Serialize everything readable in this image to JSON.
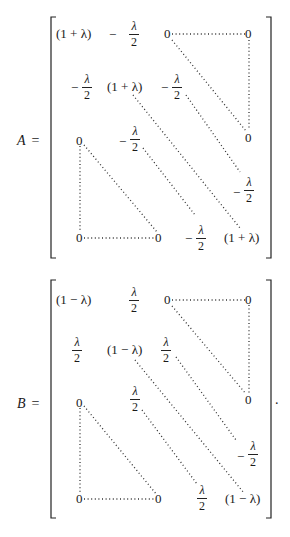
{
  "matrices": [
    {
      "label": "A",
      "equals": "=",
      "diag": "(1 + λ)",
      "off_diag_num": "λ",
      "off_diag_den": "2",
      "off_diag_sign": "−",
      "zero": "0",
      "entries": {
        "r1c1": "(1 + λ)",
        "r1c2": "−λ/2",
        "r1c3": "0",
        "r1c5": "0",
        "r2c1": "−λ/2",
        "r2c2": "(1 + λ)",
        "r2c3": "−λ/2",
        "r3c1": "0",
        "r3c2": "−λ/2",
        "r3c5": "0",
        "r4c5": "−λ/2",
        "r5c1": "0",
        "r5c3": "0",
        "r5c4": "−λ/2",
        "r5c5": "(1 + λ)"
      }
    },
    {
      "label": "B",
      "equals": "=",
      "diag": "(1 − λ)",
      "off_diag_num": "λ",
      "off_diag_den": "2",
      "off_diag_sign": "",
      "anomaly_sign": "−",
      "zero": "0",
      "trailing_punctuation": ".",
      "entries": {
        "r1c1": "(1 − λ)",
        "r1c2": "λ/2",
        "r1c3": "0",
        "r1c5": "0",
        "r2c1": "λ/2",
        "r2c2": "(1 − λ)",
        "r2c3": "λ/2",
        "r3c1": "0",
        "r3c2": "λ/2",
        "r3c5": "0",
        "r4c5": "−λ/2",
        "r5c1": "0",
        "r5c3": "0",
        "r5c4": "λ/2",
        "r5c5": "(1 − λ)"
      }
    }
  ]
}
